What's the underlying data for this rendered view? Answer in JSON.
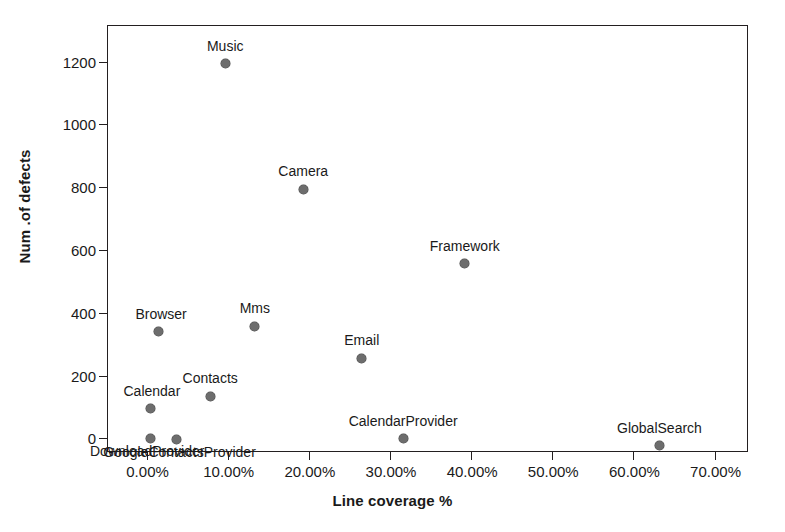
{
  "chart_data": {
    "type": "scatter",
    "title": "",
    "xlabel": "Line coverage %",
    "ylabel": "Num .of defects",
    "xlim": [
      -5.0,
      74.0
    ],
    "ylim": [
      -40,
      1320
    ],
    "grid": false,
    "legend": "none",
    "marker_color": "#6d6d6d",
    "axis_color": "#231f20",
    "xticks": [
      "0.00%",
      "10.00%",
      "20.00%",
      "30.00%",
      "40.00%",
      "50.00%",
      "60.00%",
      "70.00%"
    ],
    "xtick_values": [
      0,
      10,
      20,
      30,
      40,
      50,
      60,
      70
    ],
    "yticks": [
      "0",
      "200",
      "400",
      "600",
      "800",
      "1000",
      "1200"
    ],
    "ytick_values": [
      0,
      200,
      400,
      600,
      800,
      1000,
      1200
    ],
    "points": [
      {
        "label": "Music",
        "x": 9.6,
        "y": 1197,
        "label_dx": 0,
        "label_dy": -18,
        "label_align": "center"
      },
      {
        "label": "Camera",
        "x": 19.2,
        "y": 797,
        "label_dx": 0,
        "label_dy": -18,
        "label_align": "center"
      },
      {
        "label": "Framework",
        "x": 39.1,
        "y": 560,
        "label_dx": 0,
        "label_dy": -18,
        "label_align": "center"
      },
      {
        "label": "Mms",
        "x": 13.2,
        "y": 360,
        "label_dx": 0,
        "label_dy": -18,
        "label_align": "center"
      },
      {
        "label": "Browser",
        "x": 1.4,
        "y": 343,
        "label_dx": 2,
        "label_dy": -18,
        "label_align": "center"
      },
      {
        "label": "Email",
        "x": 26.4,
        "y": 258,
        "label_dx": 0,
        "label_dy": -18,
        "label_align": "center"
      },
      {
        "label": "Contacts",
        "x": 7.7,
        "y": 137,
        "label_dx": 0,
        "label_dy": -18,
        "label_align": "center"
      },
      {
        "label": "Calendar",
        "x": 0.3,
        "y": 97,
        "label_dx": 2,
        "label_dy": -18,
        "label_align": "center"
      },
      {
        "label": "DownloadProvider",
        "x": 0.3,
        "y": 4,
        "label_dx": -3,
        "label_dy": 13,
        "label_align": "center"
      },
      {
        "label": "GoogleContactsProvider",
        "x": 3.6,
        "y": 0,
        "label_dx": 3,
        "label_dy": 13,
        "label_align": "center"
      },
      {
        "label": "CalendarProvider",
        "x": 31.5,
        "y": 4,
        "label_dx": 0,
        "label_dy": -17,
        "label_align": "center"
      },
      {
        "label": "GlobalSearch",
        "x": 63.1,
        "y": -18,
        "label_dx": 0,
        "label_dy": -17,
        "label_align": "center"
      }
    ]
  }
}
